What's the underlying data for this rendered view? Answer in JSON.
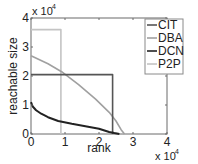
{
  "chart_data": {
    "type": "line",
    "title": "",
    "xlabel": "rank",
    "ylabel": "reachable size",
    "x_multiplier": "x 10",
    "x_multiplier_exp": "4",
    "y_multiplier": "x 10",
    "y_multiplier_exp": "4",
    "xlim": [
      0,
      4
    ],
    "ylim": [
      0,
      4
    ],
    "xticks": [
      "0",
      "1",
      "2",
      "3",
      "4"
    ],
    "yticks": [
      "0",
      "1",
      "2",
      "3",
      "4"
    ],
    "grid": false,
    "legend_position": "upper right",
    "series": [
      {
        "name": "CIT",
        "color": "#555555",
        "points": [
          [
            0,
            2.05
          ],
          [
            2.4,
            2.05
          ],
          [
            2.4,
            0
          ]
        ]
      },
      {
        "name": "DBA",
        "color": "#a0a0a0",
        "points": [
          [
            0,
            2.7
          ],
          [
            0.5,
            2.42
          ],
          [
            0.9,
            2.15
          ],
          [
            1.4,
            1.7
          ],
          [
            1.9,
            1.2
          ],
          [
            2.3,
            0.75
          ],
          [
            2.5,
            0.45
          ],
          [
            2.65,
            0.15
          ],
          [
            2.75,
            0
          ]
        ]
      },
      {
        "name": "DCN",
        "color": "#222222",
        "points": [
          [
            0,
            1.1
          ],
          [
            0.05,
            0.95
          ],
          [
            0.15,
            0.82
          ],
          [
            0.3,
            0.7
          ],
          [
            0.5,
            0.58
          ],
          [
            0.8,
            0.45
          ],
          [
            1.2,
            0.35
          ],
          [
            1.6,
            0.27
          ],
          [
            2.0,
            0.18
          ],
          [
            2.3,
            0.07
          ],
          [
            2.45,
            0.03
          ],
          [
            2.6,
            0
          ]
        ]
      },
      {
        "name": "P2P",
        "color": "#c4c4c4",
        "points": [
          [
            0,
            3.6
          ],
          [
            0.88,
            3.6
          ],
          [
            0.88,
            0
          ]
        ]
      }
    ]
  },
  "legend": {
    "items": [
      {
        "label": "CIT",
        "color": "#555555"
      },
      {
        "label": "DBA",
        "color": "#a0a0a0"
      },
      {
        "label": "DCN",
        "color": "#222222"
      },
      {
        "label": "P2P",
        "color": "#c4c4c4"
      }
    ]
  }
}
